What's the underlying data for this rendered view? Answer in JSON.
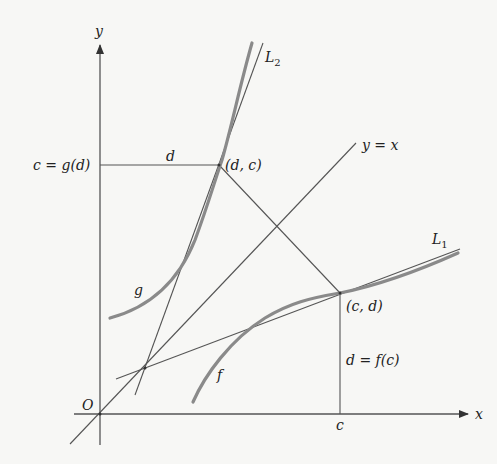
{
  "diagram": {
    "type": "inverse-function-tangent-lines",
    "axes": {
      "x_label": "x",
      "y_label": "y",
      "origin_label": "O"
    },
    "curves": [
      {
        "name": "g",
        "label": "g"
      },
      {
        "name": "f",
        "label": "f"
      }
    ],
    "lines": [
      {
        "name": "L1",
        "label_main": "L",
        "label_sub": "1"
      },
      {
        "name": "L2",
        "label_main": "L",
        "label_sub": "2"
      },
      {
        "name": "identity",
        "label": "y = x"
      }
    ],
    "points": {
      "dc": "(d, c)",
      "cd": "(c, d)"
    },
    "annotations": {
      "y_tick": "c = g(d)",
      "horizontal_segment": "d",
      "vertical_segment": "d = f(c)",
      "x_tick": "c"
    }
  }
}
